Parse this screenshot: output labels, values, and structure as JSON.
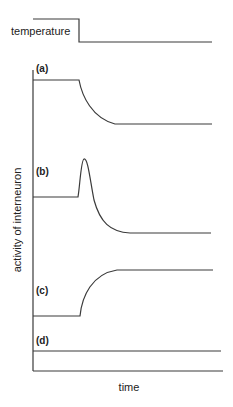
{
  "diagram": {
    "temperature_label": "temperature",
    "y_axis_label": "activity of interneuron",
    "x_axis_label": "time",
    "panels": [
      {
        "id": "a",
        "label": "(a)",
        "behavior": "high then decays to lower steady level"
      },
      {
        "id": "b",
        "label": "(b)",
        "behavior": "transient spike then decays below baseline"
      },
      {
        "id": "c",
        "label": "(c)",
        "behavior": "low then rises to higher steady level"
      },
      {
        "id": "d",
        "label": "(d)",
        "behavior": "constant, no change"
      }
    ],
    "colors": {
      "line": "#3a3a3a",
      "text": "#222222",
      "background": "#ffffff"
    }
  }
}
